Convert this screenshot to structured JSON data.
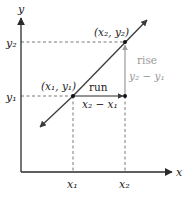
{
  "diagram": {
    "axes": {
      "x_label": "x",
      "y_label": "y"
    },
    "points": [
      {
        "label": "(x₁, y₁)",
        "x_tick": "x₁",
        "y_tick": "y₁"
      },
      {
        "label": "(x₂, y₂)",
        "x_tick": "x₂",
        "y_tick": "y₂"
      }
    ],
    "run": {
      "label": "run",
      "expression": "x₂ − x₁"
    },
    "rise": {
      "label": "rise",
      "expression": "y₂ − y₁"
    },
    "colors": {
      "line": "#3a3a3a",
      "axis": "#2a2a2a",
      "dashed": "#555555",
      "rise": "#9a9a9a",
      "text": "#222222"
    }
  }
}
